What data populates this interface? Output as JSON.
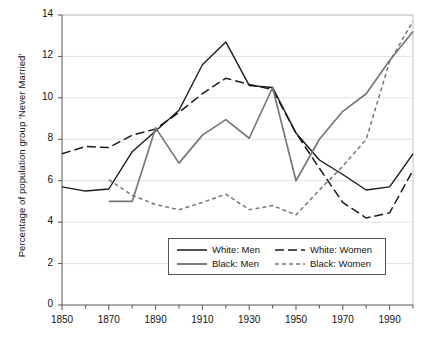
{
  "chart_data": {
    "type": "line",
    "title": "",
    "xlabel": "",
    "ylabel": "Percentage of population group 'Never Married'",
    "xlim": [
      1850,
      2000
    ],
    "ylim": [
      0,
      14
    ],
    "ytick_labels": [
      "0",
      "2",
      "4",
      "6",
      "8",
      "10",
      "12",
      "14"
    ],
    "ytick_values": [
      0,
      2,
      4,
      6,
      8,
      10,
      12,
      14
    ],
    "xtick_labels": [
      "1850",
      "1870",
      "1890",
      "1910",
      "1930",
      "1950",
      "1970",
      "1990"
    ],
    "xtick_values": [
      1850,
      1870,
      1890,
      1910,
      1930,
      1950,
      1970,
      1990
    ],
    "x_minor_interval": 10,
    "grid": "horizontal",
    "legend_position": "lower-center",
    "series": [
      {
        "name": "White: Men",
        "color": "#1a1a1a",
        "style": "solid",
        "x": [
          1850,
          1860,
          1870,
          1880,
          1890,
          1900,
          1910,
          1920,
          1930,
          1940,
          1950,
          1960,
          1970,
          1980,
          1990,
          2000
        ],
        "values": [
          5.7,
          5.5,
          5.6,
          7.4,
          8.4,
          9.4,
          11.6,
          12.7,
          10.6,
          10.5,
          8.3,
          7.0,
          6.3,
          5.55,
          5.7,
          7.3
        ]
      },
      {
        "name": "White: Women",
        "color": "#1a1a1a",
        "style": "dashed",
        "x": [
          1850,
          1860,
          1870,
          1880,
          1890,
          1900,
          1910,
          1920,
          1930,
          1940,
          1950,
          1960,
          1970,
          1980,
          1990,
          2000
        ],
        "values": [
          7.3,
          7.65,
          7.6,
          8.2,
          8.5,
          9.3,
          10.2,
          10.95,
          10.65,
          10.4,
          8.3,
          6.6,
          4.95,
          4.2,
          4.45,
          6.5
        ]
      },
      {
        "name": "Black: Men",
        "color": "#777777",
        "style": "solid",
        "x": [
          1870,
          1880,
          1890,
          1900,
          1910,
          1920,
          1930,
          1940,
          1950,
          1960,
          1970,
          1980,
          1990,
          2000
        ],
        "values": [
          5.0,
          5.0,
          8.55,
          6.85,
          8.2,
          8.95,
          8.05,
          10.5,
          6.0,
          8.0,
          9.35,
          10.2,
          11.8,
          13.2
        ]
      },
      {
        "name": "Black: Women",
        "color": "#777777",
        "style": "dotted",
        "x": [
          1870,
          1880,
          1890,
          1900,
          1910,
          1920,
          1930,
          1940,
          1950,
          1960,
          1970,
          1980,
          1990,
          2000
        ],
        "values": [
          6.05,
          5.3,
          4.85,
          4.6,
          4.95,
          5.35,
          4.6,
          4.8,
          4.35,
          5.55,
          6.7,
          8.0,
          11.75,
          13.7
        ]
      }
    ]
  },
  "legend": {
    "entries": [
      {
        "label": "White: Men"
      },
      {
        "label": "White: Women"
      },
      {
        "label": "Black: Men"
      },
      {
        "label": "Black: Women"
      }
    ]
  }
}
